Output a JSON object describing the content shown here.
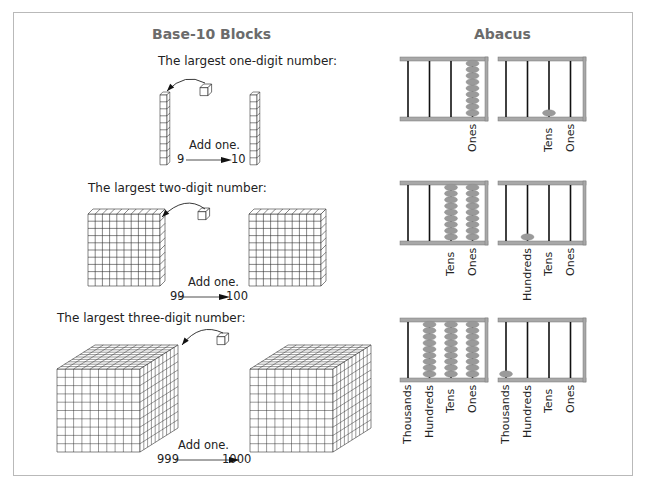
{
  "left_panel": {
    "title": "Base-10 Blocks",
    "rows": [
      {
        "caption": "The largest one-digit number:",
        "action": "Add one.",
        "from": "9",
        "to": "10"
      },
      {
        "caption": "The largest two-digit number:",
        "action": "Add one.",
        "from": "99",
        "to": "100"
      },
      {
        "caption": "The largest three-digit number:",
        "action": "Add one.",
        "from": "999",
        "to": "1000"
      }
    ]
  },
  "right_panel": {
    "title": "Abacus",
    "rows": [
      {
        "before_labels": [
          "Ones"
        ],
        "after_labels": [
          "Tens",
          "Ones"
        ],
        "before_beads": [
          0,
          0,
          0,
          9
        ],
        "after_beads": [
          0,
          0,
          1,
          0
        ]
      },
      {
        "before_labels": [
          "Tens",
          "Ones"
        ],
        "after_labels": [
          "Hundreds",
          "Tens",
          "Ones"
        ],
        "before_beads": [
          0,
          0,
          9,
          9
        ],
        "after_beads": [
          0,
          1,
          0,
          0
        ]
      },
      {
        "before_labels": [
          "Thousands",
          "Hundreds",
          "Tens",
          "Ones"
        ],
        "after_labels": [
          "Thousands",
          "Hundreds",
          "Tens",
          "Ones"
        ],
        "before_beads": [
          0,
          9,
          9,
          9
        ],
        "after_beads": [
          1,
          0,
          0,
          0
        ]
      }
    ]
  },
  "colors": {
    "bead": "#9a9a9a",
    "frame": "#a8a8a8",
    "rod": "#111111",
    "title": "#6b6b6b"
  }
}
